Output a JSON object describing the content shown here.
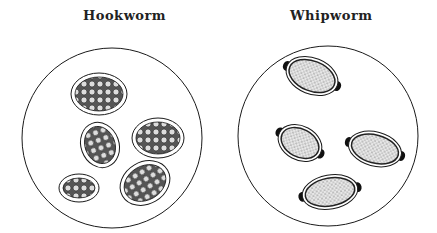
{
  "panels": [
    {
      "title": "Hookworm",
      "description": "Oval eggs with thin clear shell containing segmented cellular contents"
    },
    {
      "title": "Whipworm",
      "description": "Barrel-shaped eggs with stippled contents and polar plugs at each end"
    }
  ],
  "colors": {
    "outline": "#1a1a1a",
    "background": "#ffffff"
  }
}
